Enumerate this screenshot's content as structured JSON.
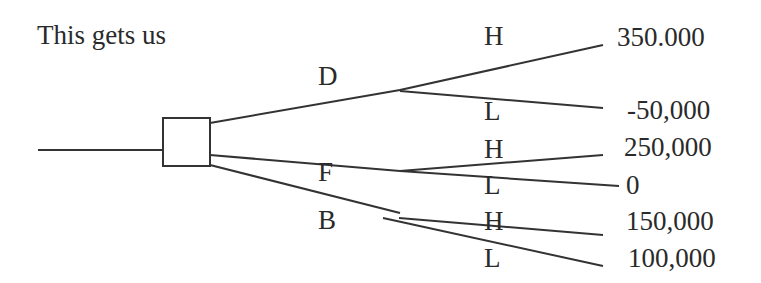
{
  "heading": "This gets us",
  "colors": {
    "line": "#333333",
    "text": "#2a2a2a",
    "background": "#ffffff"
  },
  "decision_node": {
    "shape": "square",
    "label": ""
  },
  "branches": [
    {
      "label": "D",
      "outcomes": [
        {
          "label": "H",
          "payoff": "350.000"
        },
        {
          "label": "L",
          "payoff": "-50,000"
        }
      ]
    },
    {
      "label": "F",
      "outcomes": [
        {
          "label": "H",
          "payoff": "250,000"
        },
        {
          "label": "L",
          "payoff": "0"
        }
      ]
    },
    {
      "label": "B",
      "outcomes": [
        {
          "label": "H",
          "payoff": "150,000"
        },
        {
          "label": "L",
          "payoff": "100,000"
        }
      ]
    }
  ]
}
